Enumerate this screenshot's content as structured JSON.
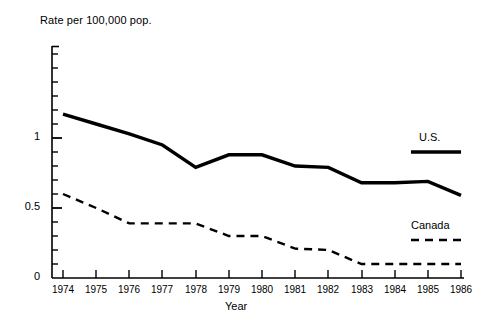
{
  "chart_data": {
    "type": "line",
    "title": "",
    "ylabel": "Rate per 100,000 pop.",
    "xlabel": "Year",
    "categories": [
      "1974",
      "1975",
      "1976",
      "1977",
      "1978",
      "1979",
      "1980",
      "1981",
      "1982",
      "1983",
      "1984",
      "1985",
      "1986"
    ],
    "x": [
      1974,
      1975,
      1976,
      1977,
      1978,
      1979,
      1980,
      1981,
      1982,
      1983,
      1984,
      1985,
      1986
    ],
    "xlim": [
      1974,
      1986
    ],
    "ylim": [
      0,
      1.45
    ],
    "yticks_labeled": [
      "0",
      "0.5",
      "1"
    ],
    "ytick_values": [
      0,
      0.5,
      1
    ],
    "yminor_step": 0.1,
    "grid": false,
    "legend_position": "right-inside",
    "series": [
      {
        "name": "U.S.",
        "style": "solid",
        "color": "#000000",
        "values": [
          1.17,
          1.1,
          1.03,
          0.95,
          0.79,
          0.88,
          0.88,
          0.8,
          0.79,
          0.68,
          0.68,
          0.69,
          0.59
        ]
      },
      {
        "name": "Canada",
        "style": "dashed",
        "color": "#000000",
        "values": [
          0.6,
          0.5,
          0.39,
          0.39,
          0.39,
          0.3,
          0.3,
          0.21,
          0.2,
          0.1,
          0.1,
          0.1,
          0.1
        ]
      }
    ]
  },
  "axes": {
    "ylabel_text": "Rate per 100,000 pop.",
    "xlabel_text": "Year",
    "ytick_0": "0",
    "ytick_05": "0.5",
    "ytick_1": "1"
  },
  "legend": {
    "us_label": "U.S.",
    "canada_label": "Canada"
  }
}
